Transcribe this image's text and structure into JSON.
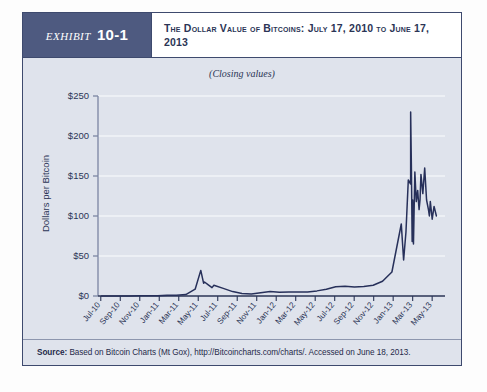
{
  "exhibit": {
    "word": "Exhibit",
    "number": "10-1",
    "title": "The Dollar Value of Bitcoins: July 17, 2010 to June 17, 2013"
  },
  "panel": {
    "subtitle": "(Closing values)"
  },
  "source": {
    "label": "Source:",
    "text": "Based on Bitcoin Charts (Mt Gox), http://Bitcoincharts.com/charts/. Accessed on June 18, 2013."
  },
  "colors": {
    "header_navy": "#4e5a80",
    "panel_bg": "#dfe3ec",
    "line": "#27305a",
    "grid": "#f2f4f8",
    "axis": "#2b3556",
    "text": "#2b3556"
  },
  "chart_data": {
    "type": "line",
    "title": "The Dollar Value of Bitcoins: July 17, 2010 to June 17, 2013",
    "subtitle": "(Closing values)",
    "xlabel": "",
    "ylabel": "Dollars per Bitcoin",
    "ylim": [
      0,
      250
    ],
    "ytick_values": [
      0,
      50,
      100,
      150,
      200,
      250
    ],
    "ytick_labels": [
      "$0",
      "$50",
      "$100",
      "$150",
      "$200",
      "$250"
    ],
    "grid": true,
    "legend": "none",
    "xtick_labels": [
      "Jul-10",
      "Sep-10",
      "Nov-10",
      "Jan-11",
      "Mar-11",
      "May-11",
      "Jul-11",
      "Sep-11",
      "Nov-11",
      "Jan-12",
      "Mar-12",
      "May-12",
      "Jul-12",
      "Sep-12",
      "Nov-12",
      "Jan-13",
      "Mar-13",
      "May-13"
    ],
    "series": [
      {
        "name": "Bitcoin closing price (USD)",
        "x": [
          "Jul-10",
          "Aug-10",
          "Sep-10",
          "Oct-10",
          "Nov-10",
          "Dec-10",
          "Jan-11",
          "Feb-11",
          "Mar-11",
          "Apr-11",
          "May-11",
          "Jun-11",
          "Jul-11",
          "Aug-11",
          "Sep-11",
          "Oct-11",
          "Nov-11",
          "Dec-11",
          "Jan-12",
          "Feb-12",
          "Mar-12",
          "Apr-12",
          "May-12",
          "Jun-12",
          "Jul-12",
          "Aug-12",
          "Sep-12",
          "Oct-12",
          "Nov-12",
          "Dec-12",
          "Jan-13",
          "Feb-13",
          "Mar-13",
          "Apr-13",
          "May-13",
          "Jun-13"
        ],
        "values": [
          0.08,
          0.07,
          0.06,
          0.12,
          0.25,
          0.24,
          0.4,
          1.0,
          0.9,
          1.8,
          8.5,
          17.5,
          13.5,
          9.5,
          5.5,
          3.2,
          2.6,
          4.2,
          5.5,
          4.8,
          4.9,
          4.9,
          5.1,
          6.4,
          8.5,
          11.5,
          12.3,
          11.3,
          11.9,
          13.4,
          18.5,
          30.0,
          90.0,
          140.0,
          120.0,
          100.0
        ],
        "notable_points": [
          {
            "label": "2011 bubble peak",
            "x": "Jun-11",
            "value": 32
          },
          {
            "label": "All-time peak",
            "x": "Apr-13",
            "value": 230
          },
          {
            "label": "Post-crash low",
            "x": "Apr-13",
            "value": 65
          },
          {
            "label": "Final value",
            "x": "Jun-13",
            "value": 100
          }
        ]
      }
    ]
  }
}
